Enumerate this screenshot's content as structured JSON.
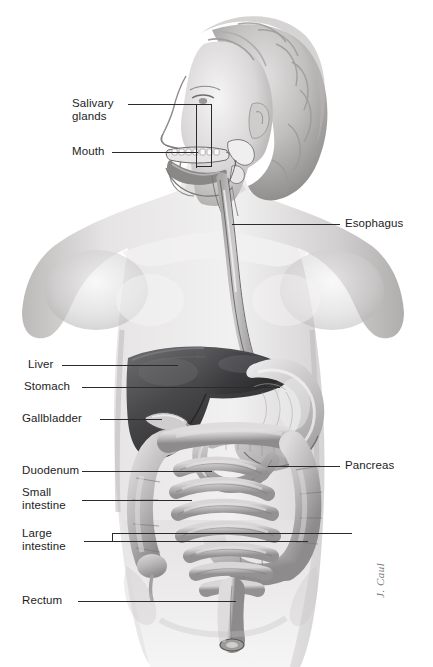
{
  "figure": {
    "background_color": "#ffffff",
    "leader_line_color": "#2b2b2b",
    "label_text_color": "#1d1d1d",
    "artist_signature": "J. Caul"
  },
  "labels": {
    "salivary_glands": "Salivary\nglands",
    "mouth": "Mouth",
    "esophagus": "Esophagus",
    "liver": "Liver",
    "stomach": "Stomach",
    "gallbladder": "Gallbladder",
    "duodenum": "Duodenum",
    "small_intestine": "Small\nintestine",
    "large_intestine": "Large\nintestine",
    "pancreas": "Pancreas",
    "rectum": "Rectum"
  },
  "anatomy_parts": [
    {
      "name": "salivary-glands",
      "side": "left",
      "label": "Salivary glands"
    },
    {
      "name": "mouth",
      "side": "left",
      "label": "Mouth"
    },
    {
      "name": "esophagus",
      "side": "right",
      "label": "Esophagus"
    },
    {
      "name": "liver",
      "side": "left",
      "label": "Liver"
    },
    {
      "name": "stomach",
      "side": "left",
      "label": "Stomach"
    },
    {
      "name": "gallbladder",
      "side": "left",
      "label": "Gallbladder"
    },
    {
      "name": "duodenum",
      "side": "left",
      "label": "Duodenum"
    },
    {
      "name": "small-intestine",
      "side": "left",
      "label": "Small intestine"
    },
    {
      "name": "large-intestine",
      "side": "left",
      "label": "Large intestine"
    },
    {
      "name": "pancreas",
      "side": "right",
      "label": "Pancreas"
    },
    {
      "name": "rectum",
      "side": "left",
      "label": "Rectum"
    }
  ],
  "palette": {
    "skin_light": "#eceaea",
    "skin_mid": "#c9c6c6",
    "skin_shadow": "#a8a5a5",
    "hair_light": "#d8d6d6",
    "hair_dark": "#8e8b8b",
    "liver_dark": "#3a3a3c",
    "liver_mid": "#565659",
    "stomach_light": "#c5c3c3",
    "intestine_mid": "#b0aeae",
    "outline": "#4a4a4a"
  }
}
